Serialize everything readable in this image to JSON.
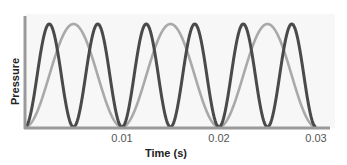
{
  "chart_data": {
    "type": "line",
    "title": "",
    "xlabel": "Time (s)",
    "ylabel": "Pressure",
    "xlim": [
      0,
      0.031
    ],
    "ylim": [
      0,
      1
    ],
    "grid": false,
    "legend": null,
    "x_ticks": [
      "0.01",
      "0.02",
      "0.03"
    ],
    "x_tick_values": [
      0.01,
      0.02,
      0.03
    ],
    "series": [
      {
        "name": "higher-frequency wave",
        "color": "#4a4a4a",
        "frequency_hz": 200,
        "period_s": 0.005,
        "shape": "raised-cosine starting at minimum",
        "amplitude": 1,
        "peaks_s": [
          0.0025,
          0.0075,
          0.0125,
          0.0175,
          0.0225,
          0.0275
        ]
      },
      {
        "name": "lower-frequency wave",
        "color": "#a9a9a9",
        "frequency_hz": 100,
        "period_s": 0.01,
        "shape": "raised-cosine starting at minimum",
        "amplitude": 1,
        "peaks_s": [
          0.005,
          0.015,
          0.025
        ]
      }
    ]
  },
  "colors": {
    "axis": "#9a9a9a",
    "plot_bg": "#f7f7f7",
    "dark_wave": "#4a4a4a",
    "light_wave": "#a9a9a9"
  }
}
